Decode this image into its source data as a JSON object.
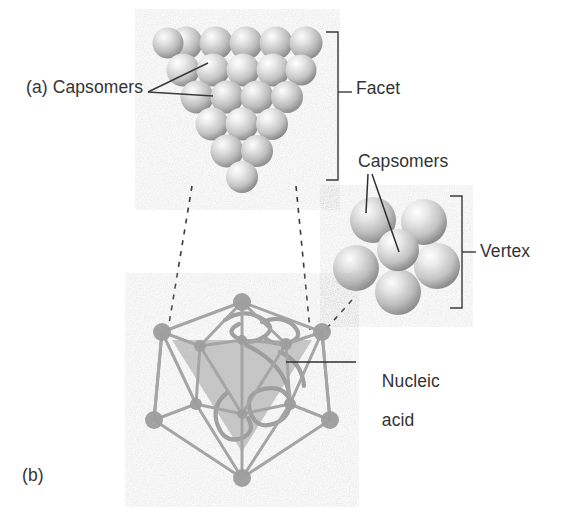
{
  "figure": {
    "panel_a_label": "(a) Capsomers",
    "panel_b_label": "(b)",
    "labels": {
      "capsomers_facet": "(a) Capsomers",
      "facet": "Facet",
      "capsomers_vertex": "Capsomers",
      "vertex": "Vertex",
      "nucleic_acid_line1": "Nucleic",
      "nucleic_acid_line2": "acid",
      "panel_b": "(b)"
    },
    "colors": {
      "background": "#ffffff",
      "text": "#333333",
      "line": "#3a3a3a",
      "capsomer_light": "#ededed",
      "capsomer_mid": "#c2c2c2",
      "capsomer_dark": "#8f8f8f",
      "wireframe": "#a8a8a8",
      "facet_shade": "#b9b9b9",
      "nucleic_strand": "#9a9a9a"
    },
    "structures": {
      "facet_triangle": {
        "name": "triangular facet of capsomers",
        "orientation": "inverted triangle, apex down",
        "rows": [
          6,
          5,
          4,
          3,
          2,
          1
        ],
        "total_capsomers": 21
      },
      "vertex_cluster": {
        "name": "vertex capsomer cluster (pentamer)",
        "outer_capsomers": 5,
        "center_capsomers": 1,
        "total_capsomers": 6
      },
      "icosahedron": {
        "name": "icosahedral capsid wireframe",
        "vertices": 12,
        "faces": 20,
        "contains": "coiled nucleic acid",
        "highlighted_face": "one shaded triangular facet"
      }
    },
    "connectors": {
      "capsomers_a_leaders": 2,
      "capsomers_vertex_leaders": 2,
      "facet_bracket": "right brace spanning facet panel",
      "vertex_bracket": "right brace spanning vertex cluster",
      "nucleic_acid_leader": "horizontal line to capsid interior",
      "dashed_facet_to_capsid": 2,
      "dashed_vertex_to_capsid": 1
    }
  }
}
